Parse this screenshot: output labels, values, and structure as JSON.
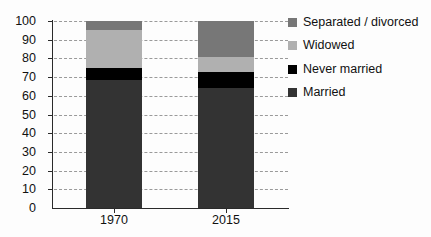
{
  "chart_data": {
    "type": "bar",
    "subtype": "stacked-bar-100-percent",
    "title": "",
    "xlabel": "",
    "ylabel": "",
    "categories": [
      "1970",
      "2015"
    ],
    "ylim": [
      0,
      100
    ],
    "yticks": [
      0,
      10,
      20,
      30,
      40,
      50,
      60,
      70,
      80,
      90,
      100
    ],
    "ytick_labels": [
      "0",
      "10",
      "20",
      "30",
      "40",
      "50",
      "60",
      "70",
      "80",
      "90",
      "100"
    ],
    "grid": true,
    "legend_position": "right",
    "series": [
      {
        "name": "Married",
        "color": "#333333",
        "values": [
          68.5,
          64
        ]
      },
      {
        "name": "Never married",
        "color": "#000000",
        "values": [
          6.5,
          9
        ]
      },
      {
        "name": "Widowed",
        "color": "#b0b0b0",
        "values": [
          20,
          8
        ]
      },
      {
        "name": "Separated / divorced",
        "color": "#777777",
        "values": [
          5,
          19
        ]
      }
    ],
    "stack_order_bottom_to_top": [
      "Married",
      "Never married",
      "Widowed",
      "Separated / divorced"
    ]
  },
  "legend": {
    "items": [
      {
        "label": "Separated / divorced",
        "color": "#777777"
      },
      {
        "label": "Widowed",
        "color": "#b0b0b0"
      },
      {
        "label": "Never married",
        "color": "#000000"
      },
      {
        "label": "Married",
        "color": "#333333"
      }
    ]
  },
  "colors": {
    "axis": "#2a2a2a",
    "grid": "#9a9a9a",
    "text": "#111111",
    "background": "#fdfdfd"
  }
}
